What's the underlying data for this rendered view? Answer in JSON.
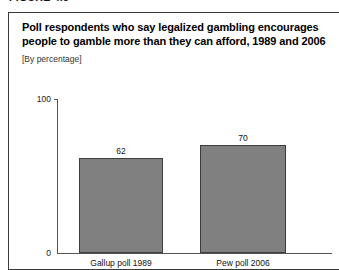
{
  "figure": {
    "label": "FIGURE 4.5"
  },
  "chart_data": {
    "type": "bar",
    "title": "Poll respondents who say legalized gambling encourages people to gamble more than they can afford, 1989 and 2006",
    "title_lines": [
      "Poll respondents who say legalized gambling encourages",
      "people to gamble more than they can afford, 1989 and 2006"
    ],
    "subtitle": "[By percentage]",
    "categories": [
      "Gallup poll 1989",
      "Pew poll 2006"
    ],
    "values": [
      62,
      70
    ],
    "value_labels": [
      "62",
      "70"
    ],
    "xlabel": "",
    "ylabel": "",
    "ylim": [
      0,
      100
    ],
    "ytick_labels": [
      "0",
      "100"
    ],
    "grid": false,
    "legend": false,
    "bar_color": "#808080",
    "bar_border_color": "#3d3d3d",
    "axis_color": "#555555"
  }
}
